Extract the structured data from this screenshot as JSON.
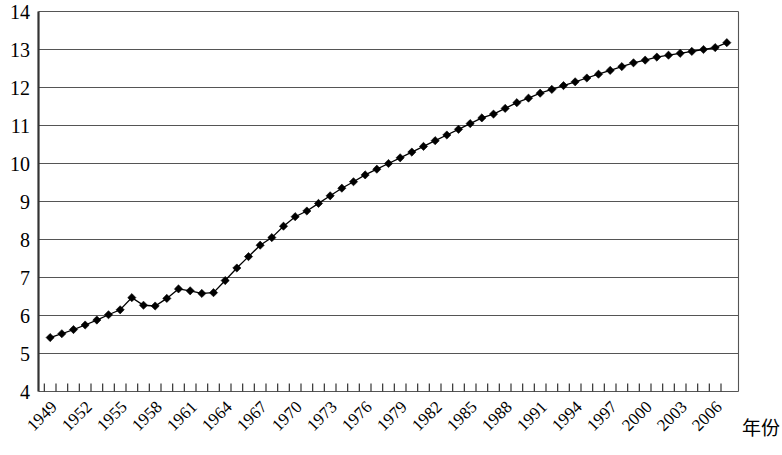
{
  "chart_data": {
    "type": "line",
    "title": "",
    "subtitle": "",
    "xlabel": "年份",
    "ylabel": "",
    "xlim": [
      1948,
      2008
    ],
    "ylim": [
      4,
      14
    ],
    "grid": true,
    "grid_axis": "y",
    "legend": false,
    "legend_position": "none",
    "marker": "diamond",
    "marker_color": "#000000",
    "line_color": "#000000",
    "y_ticks": [
      4,
      5,
      6,
      7,
      8,
      9,
      10,
      11,
      12,
      13,
      14
    ],
    "y_tick_labels": [
      "4",
      "5",
      "6",
      "7",
      "8",
      "9",
      "10",
      "11",
      "12",
      "13",
      "14"
    ],
    "x_tick_labels": [
      "1949",
      "1952",
      "1955",
      "1958",
      "1961",
      "1964",
      "1967",
      "1970",
      "1973",
      "1976",
      "1979",
      "1982",
      "1985",
      "1988",
      "1991",
      "1994",
      "1997",
      "2000",
      "2003",
      "2006"
    ],
    "x_tick_label_step": 3,
    "x_minor_tick_step": 1,
    "x": [
      1949,
      1950,
      1951,
      1952,
      1953,
      1954,
      1955,
      1956,
      1957,
      1958,
      1959,
      1960,
      1961,
      1962,
      1963,
      1964,
      1965,
      1966,
      1967,
      1968,
      1969,
      1970,
      1971,
      1972,
      1973,
      1974,
      1975,
      1976,
      1977,
      1978,
      1979,
      1980,
      1981,
      1982,
      1983,
      1984,
      1985,
      1986,
      1987,
      1988,
      1989,
      1990,
      1991,
      1992,
      1993,
      1994,
      1995,
      1996,
      1997,
      1998,
      1999,
      2000,
      2001,
      2002,
      2003,
      2004,
      2005,
      2006,
      2007
    ],
    "series": [
      {
        "name": "人口",
        "values": [
          5.42,
          5.52,
          5.63,
          5.75,
          5.88,
          6.02,
          6.15,
          6.47,
          6.27,
          6.25,
          6.45,
          6.7,
          6.65,
          6.58,
          6.6,
          6.92,
          7.25,
          7.55,
          7.85,
          8.05,
          8.35,
          8.6,
          8.75,
          8.95,
          9.15,
          9.35,
          9.52,
          9.7,
          9.85,
          10.0,
          10.15,
          10.3,
          10.45,
          10.6,
          10.75,
          10.9,
          11.05,
          11.2,
          11.3,
          11.45,
          11.6,
          11.72,
          11.85,
          11.95,
          12.05,
          12.15,
          12.25,
          12.35,
          12.45,
          12.55,
          12.65,
          12.72,
          12.8,
          12.85,
          12.9,
          12.95,
          13.0,
          13.05,
          13.18
        ]
      }
    ]
  },
  "axis": {
    "x_title": "年份"
  }
}
